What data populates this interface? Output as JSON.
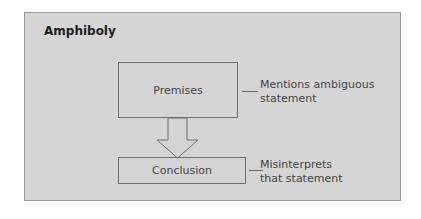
{
  "title": "Amphiboly",
  "nodes": [
    {
      "id": "premises",
      "label": "Premises",
      "note_lines": [
        "Mentions ambiguous",
        "statement"
      ]
    },
    {
      "id": "conclusion",
      "label": "Conclusion",
      "note_lines": [
        "Misinterprets",
        "that statement"
      ]
    }
  ],
  "edges": [
    {
      "from": "premises",
      "to": "conclusion",
      "style": "hollow-block-arrow"
    }
  ],
  "colors": {
    "panel": "#d5d5d5",
    "border": "#6e6e6e",
    "text": "#444444"
  }
}
